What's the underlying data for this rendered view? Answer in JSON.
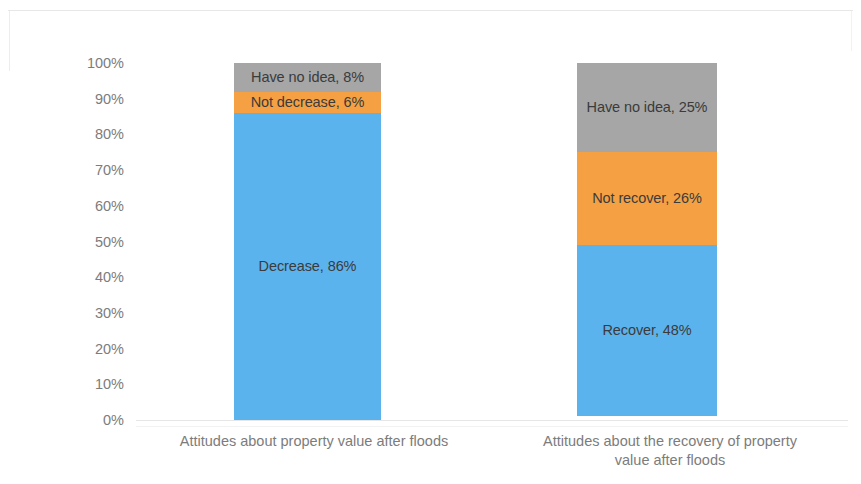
{
  "chart_data": {
    "type": "bar",
    "subtype": "100% stacked column",
    "title": "",
    "xlabel": "",
    "ylabel": "",
    "ylim": [
      0,
      100
    ],
    "grid": false,
    "legend": "none (data labels inside segments)",
    "categories": [
      "Attitudes about property value after floods",
      "Attitudes about the recovery of property value after floods"
    ],
    "category_lines": [
      [
        "Attitudes about property value after floods"
      ],
      [
        "Attitudes about the recovery of property",
        "value after floods"
      ]
    ],
    "ytick_labels": [
      "100%",
      "90%",
      "80%",
      "70%",
      "60%",
      "50%",
      "40%",
      "30%",
      "20%",
      "10%",
      "0%"
    ],
    "ytick_values": [
      100,
      90,
      80,
      70,
      60,
      50,
      40,
      30,
      20,
      10,
      0
    ],
    "series": [
      {
        "name": "Positive",
        "color": "#5BB3EE",
        "values": [
          86,
          48
        ],
        "labels": [
          "Decrease, 86%",
          "Recover, 48%"
        ],
        "value_labels": [
          "86%",
          "48%"
        ],
        "names": [
          "Decrease",
          "Recover"
        ]
      },
      {
        "name": "Negative",
        "color": "#F5A143",
        "values": [
          6,
          26
        ],
        "labels": [
          "Not decrease, 6%",
          "Not recover, 26%"
        ],
        "value_labels": [
          "6%",
          "26%"
        ],
        "names": [
          "Not decrease",
          "Not recover"
        ]
      },
      {
        "name": "Unsure",
        "color": "#A6A6A6",
        "values": [
          8,
          25
        ],
        "labels": [
          "Have no idea, 8%",
          "Have no idea, 25%"
        ],
        "value_labels": [
          "8%",
          "25%"
        ],
        "names": [
          "Have no idea",
          "Have no idea"
        ]
      }
    ],
    "colors": {
      "blue": "#5BB3EE",
      "orange": "#F5A143",
      "gray": "#A6A6A6",
      "axis_text": "#7c7c7c",
      "label_text": "#3b3b3b",
      "axis_line": "#e6e6e6",
      "background": "#ffffff"
    }
  }
}
